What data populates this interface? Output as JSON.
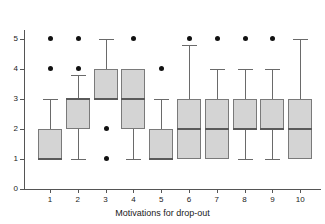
{
  "chart_data": {
    "type": "box",
    "title": "",
    "xlabel": "Motivations for drop-out",
    "ylabel": "",
    "ylim": [
      0,
      5
    ],
    "yticks": [
      "0",
      "1",
      "2",
      "3",
      "4",
      "5"
    ],
    "grid": false,
    "legend": "none",
    "categories": [
      "1",
      "2",
      "3",
      "4",
      "5",
      "6",
      "7",
      "8",
      "9",
      "10"
    ],
    "boxes": [
      {
        "category": "1",
        "q1": 1,
        "median": 1,
        "q3": 2,
        "whisker_low": 1,
        "whisker_high": 3,
        "outliers": [
          4,
          5
        ]
      },
      {
        "category": "2",
        "q1": 2,
        "median": 3,
        "q3": 3,
        "whisker_low": 1,
        "whisker_high": 3.8,
        "outliers": [
          4,
          5
        ]
      },
      {
        "category": "3",
        "q1": 3,
        "median": 3,
        "q3": 4,
        "whisker_low": 3,
        "whisker_high": 5,
        "outliers": [
          1,
          2
        ]
      },
      {
        "category": "4",
        "q1": 2,
        "median": 3,
        "q3": 4,
        "whisker_low": 1,
        "whisker_high": 4,
        "outliers": [
          5
        ]
      },
      {
        "category": "5",
        "q1": 1,
        "median": 1,
        "q3": 2,
        "whisker_low": 1,
        "whisker_high": 3,
        "outliers": [
          4
        ]
      },
      {
        "category": "6",
        "q1": 1,
        "median": 2,
        "q3": 3,
        "whisker_low": 1,
        "whisker_high": 4.8,
        "outliers": [
          5
        ]
      },
      {
        "category": "7",
        "q1": 1,
        "median": 2,
        "q3": 3,
        "whisker_low": 1,
        "whisker_high": 4,
        "outliers": [
          5
        ]
      },
      {
        "category": "8",
        "q1": 2,
        "median": 2,
        "q3": 3,
        "whisker_low": 1,
        "whisker_high": 4,
        "outliers": [
          5
        ]
      },
      {
        "category": "9",
        "q1": 2,
        "median": 2,
        "q3": 3,
        "whisker_low": 1,
        "whisker_high": 4,
        "outliers": [
          5
        ]
      },
      {
        "category": "10",
        "q1": 1,
        "median": 2,
        "q3": 3,
        "whisker_low": 1,
        "whisker_high": 5,
        "outliers": []
      }
    ],
    "colors": {
      "box_fill": "#d4d4d4",
      "box_border": "#7a7a7a",
      "median": "#5a5a5a",
      "whisker": "#6a6a6a",
      "outlier": "#111111",
      "axis": "#555555",
      "text": "#1a1a1a",
      "background": "#ffffff"
    }
  }
}
